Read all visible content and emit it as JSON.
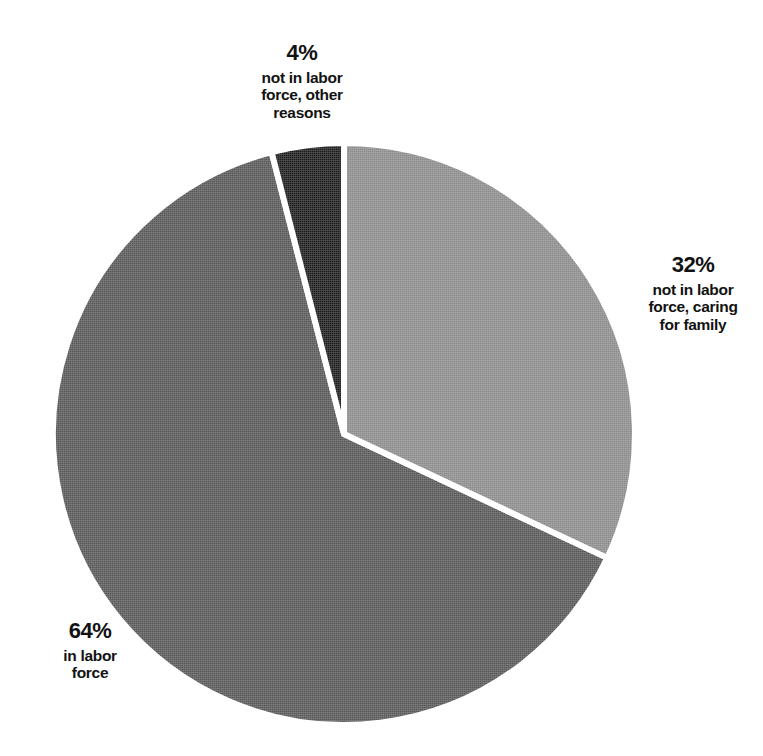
{
  "chart_data": {
    "type": "pie",
    "title": "",
    "subtitle": "",
    "xlabel": "",
    "ylabel": "",
    "legend_position": "none",
    "grid": false,
    "units": "percent",
    "total": 100,
    "start_angle_deg": 0,
    "direction": "clockwise",
    "categories": [
      "not in labor force, caring for family",
      "in labor force",
      "not in labor force, other reasons"
    ],
    "values": [
      32,
      64,
      4
    ],
    "slices": [
      {
        "id": "caring",
        "percent_label": "32%",
        "value": 32,
        "description": "not in labor force,\ncaring\nfor family",
        "color": "#8a8a8a",
        "start_deg": 0,
        "end_deg": 115.2,
        "label_position": "right"
      },
      {
        "id": "in-labor-force",
        "percent_label": "64%",
        "value": 64,
        "description": "in labor\nforce",
        "color": "#555555",
        "start_deg": 115.2,
        "end_deg": 345.6,
        "label_position": "bottom-left"
      },
      {
        "id": "other-reasons",
        "percent_label": "4%",
        "value": 4,
        "description": "not in labor\nforce, other\nreasons",
        "color": "#1a1a1a",
        "start_deg": 345.6,
        "end_deg": 360,
        "label_position": "top"
      }
    ],
    "slice_border_color": "#ffffff",
    "background_color": "#ffffff"
  },
  "labels": {
    "other": {
      "percent": "4%",
      "description": "not in labor\nforce, other\nreasons"
    },
    "caring": {
      "percent": "32%",
      "description": "not in labor\nforce, caring\nfor family"
    },
    "in_labor": {
      "percent": "64%",
      "description": "in labor\nforce"
    }
  }
}
